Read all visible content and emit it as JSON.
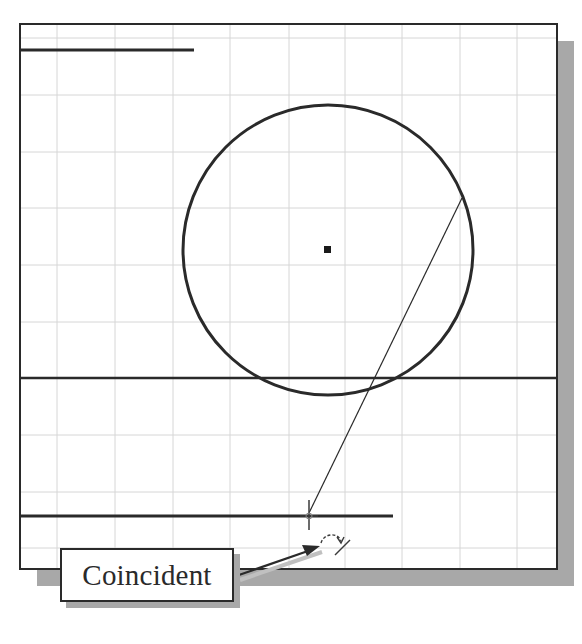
{
  "figure": {
    "type": "sketch-constraint-illustration",
    "callout": {
      "label": "Coincident"
    },
    "colors": {
      "background": "#ffffff",
      "frame": "#2a2a2a",
      "grid": "#d4d4d4",
      "shadow": "#a8a8a8",
      "geometry": "#2a2a2a"
    },
    "elements": {
      "circle": {
        "label": "circle",
        "has_center_point": true
      },
      "lines": [
        "top-short-line",
        "middle-horizontal-line",
        "bottom-horizontal-line",
        "construction-line"
      ],
      "cursor": {
        "icon": "crosshair-cursor",
        "constraint_glyph": "coincident-constraint-icon"
      }
    }
  }
}
